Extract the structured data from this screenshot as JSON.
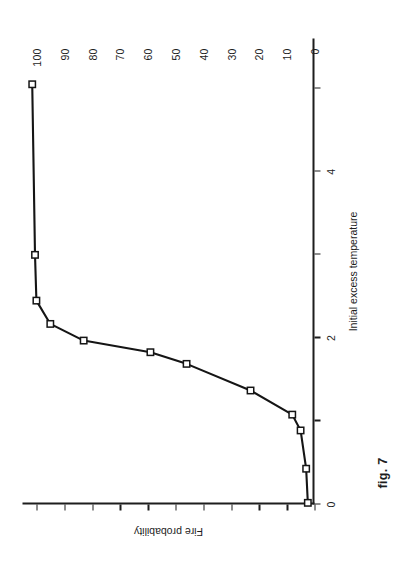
{
  "figure": {
    "caption": "fig. 7"
  },
  "chart_data": {
    "type": "line",
    "title": "",
    "xlabel": "Initial excess temperature",
    "ylabel": "Fire probability",
    "xlim": [
      0,
      5.6
    ],
    "ylim": [
      0,
      105
    ],
    "xticks": [
      0,
      1,
      2,
      3,
      4,
      5
    ],
    "xtick_labels": [
      "0",
      "",
      "2",
      "",
      "4",
      ""
    ],
    "yticks": [
      0,
      10,
      20,
      30,
      40,
      50,
      60,
      70,
      80,
      90,
      100
    ],
    "ytick_labels": [
      "0",
      "10",
      "20",
      "30",
      "40",
      "50",
      "60",
      "70",
      "80",
      "90",
      "100"
    ],
    "grid": false,
    "legend": "none",
    "marker": "square",
    "series": [
      {
        "name": "Fire probability",
        "x": [
          0.02,
          0.43,
          0.89,
          1.08,
          1.37,
          1.69,
          1.83,
          1.97,
          2.17,
          2.45,
          3.0,
          5.05
        ],
        "y": [
          2.4,
          3.0,
          5.0,
          8.0,
          23.0,
          46.0,
          59.0,
          83.0,
          95.0,
          100.0,
          100.5,
          101.5
        ]
      }
    ]
  }
}
